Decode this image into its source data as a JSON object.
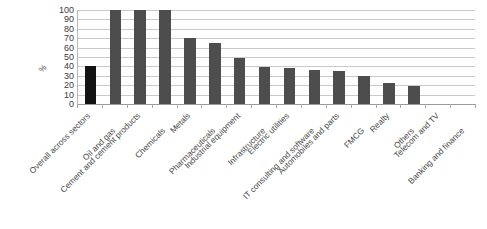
{
  "chart_data": {
    "type": "bar",
    "title": "",
    "subtitle": "",
    "xlabel": "",
    "ylabel": "%",
    "ylim": [
      0,
      100
    ],
    "ytick_step": 10,
    "grid": true,
    "legend": "none",
    "orientation": "vertical",
    "xtick_label_rotation": -45,
    "xtick_labels_staggered": true,
    "categories": [
      "Overall across sectors",
      "Oil and gas",
      "Cement and cement products",
      "Chemicals",
      "Metals",
      "Pharmaceuticals",
      "Industrial equipment",
      "Infrastructure",
      "Electric utilities",
      "IT consulting and software",
      "Automobiles and parts",
      "FMCG",
      "Realty",
      "Others",
      "Telecom and TV",
      "Banking and finance"
    ],
    "values": [
      40,
      100,
      100,
      100,
      70,
      65,
      49,
      39,
      38,
      36,
      35,
      30,
      22,
      19,
      0,
      0
    ],
    "highlight_index": 0,
    "ytick_labels": [
      "100",
      "90",
      "80",
      "70",
      "60",
      "50",
      "40",
      "30",
      "20",
      "10",
      "0"
    ],
    "ytick_values": [
      100,
      90,
      80,
      70,
      60,
      50,
      40,
      30,
      20,
      10,
      0
    ],
    "colors": {
      "bar": "#4d4d4d",
      "bar_highlight": "#131313",
      "gridline": "#c9c9c9",
      "axis": "#9a9a9a",
      "tick_text": "#3b3b3b",
      "label_text": "#4a4a4a",
      "background": "#ffffff"
    }
  }
}
